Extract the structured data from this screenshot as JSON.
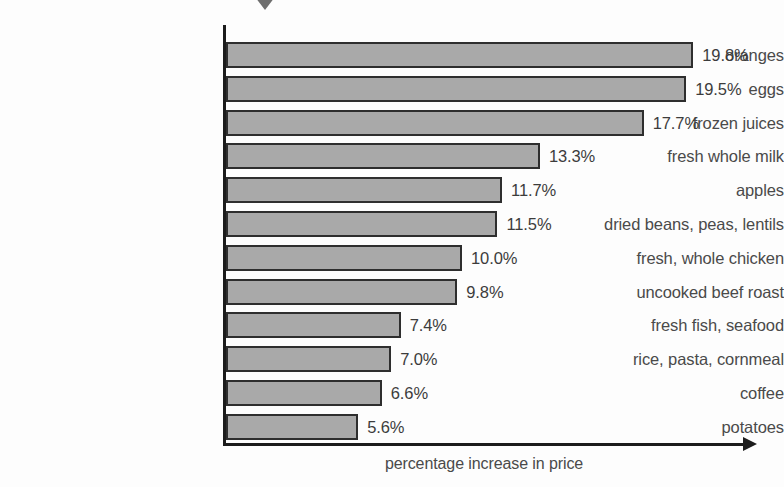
{
  "figure": {
    "background_color": "#fdfdfd",
    "marker_icon": "triangle-down-icon",
    "marker_color": "#6e6e6e",
    "bar_fill_color": "#a9a9a9",
    "bar_border_color": "#2e2e2e",
    "axis_color": "#1c1c1c",
    "text_color": "#4a4a4a"
  },
  "chart_data": {
    "type": "bar",
    "orientation": "horizontal",
    "title": "",
    "xlabel": "percentage increase in price",
    "ylabel": "",
    "grid": false,
    "legend": "none",
    "xlim": [
      0,
      22
    ],
    "value_suffix": "%",
    "categories": [
      "oranges",
      "eggs",
      "frozen juices",
      "fresh whole milk",
      "apples",
      "dried beans, peas, lentils",
      "fresh, whole chicken",
      "uncooked beef roast",
      "fresh fish, seafood",
      "rice, pasta, cornmeal",
      "coffee",
      "potatoes"
    ],
    "values": [
      19.8,
      19.5,
      17.7,
      13.3,
      11.7,
      11.5,
      10.0,
      9.8,
      7.4,
      7.0,
      6.6,
      5.6
    ],
    "value_labels": [
      "19.8%",
      "19.5%",
      "17.7%",
      "13.3%",
      "11.7%",
      "11.5%",
      "10.0%",
      "9.8%",
      "7.4%",
      "7.0%",
      "6.6%",
      "5.6%"
    ]
  }
}
